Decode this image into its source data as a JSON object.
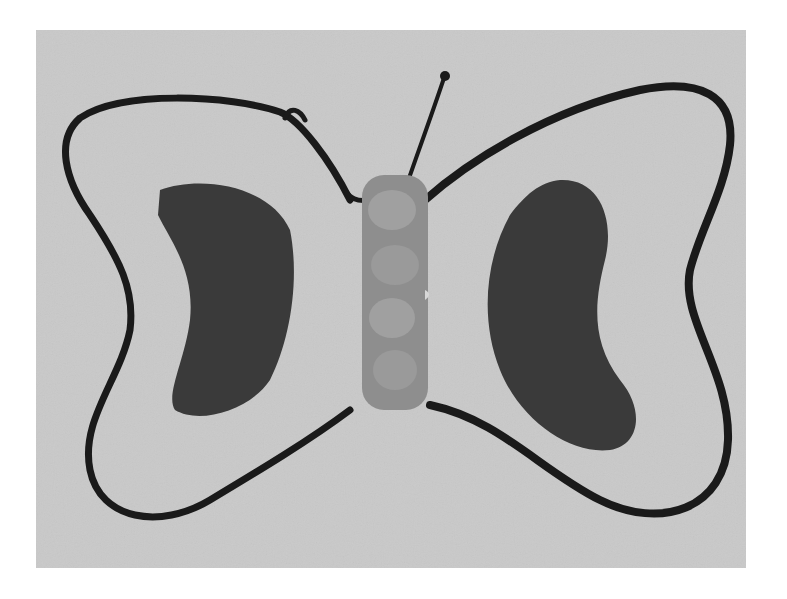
{
  "image": {
    "subject": "Hand-drawn butterfly craft",
    "description": "Grayscale photograph of a butterfly drawn with thick black marker outline, two dark crescent-shaped wing spots, and a segmented textured body with two antennae",
    "colors": {
      "background": "#ffffff",
      "paper": "#c9c9c9",
      "outline": "#1a1a1a",
      "wing_spot": "#3a3a3a",
      "body": "#8e8e8e",
      "body_segment": "#a0a0a0"
    },
    "elements": [
      "left-wing-outline",
      "right-wing-outline",
      "left-wing-spot",
      "right-wing-spot",
      "body",
      "left-antenna",
      "right-antenna"
    ]
  }
}
